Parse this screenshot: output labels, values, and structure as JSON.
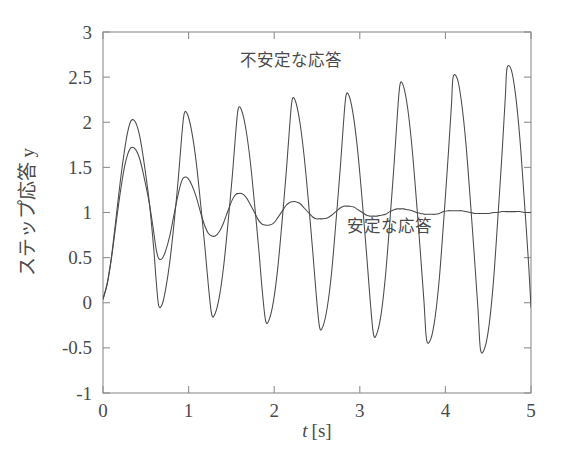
{
  "chart_data": {
    "type": "line",
    "title": "",
    "xlabel": "t [s]",
    "ylabel": "ステップ応答 y",
    "xlim": [
      0,
      5
    ],
    "ylim": [
      -1,
      3
    ],
    "grid": false,
    "legend_position": "inline-annotation",
    "xticks": [
      "0",
      "1",
      "2",
      "3",
      "4",
      "5"
    ],
    "xtick_values": [
      0,
      1,
      2,
      3,
      4,
      5
    ],
    "yticks": [
      "-1",
      "-0.5",
      "0",
      "0.5",
      "1",
      "1.5",
      "2",
      "2.5",
      "3"
    ],
    "ytick_values": [
      -1,
      -0.5,
      0,
      0.5,
      1,
      1.5,
      2,
      2.5,
      3
    ],
    "annotations": [
      {
        "text": "不安定な応答",
        "x": 2.2,
        "y": 2.62
      },
      {
        "text": "安定な応答",
        "x": 3.35,
        "y": 0.78
      }
    ],
    "series": [
      {
        "name": "不安定な応答",
        "label": "unstable-response",
        "color": "#4a4a4a",
        "steady_state": 1.0,
        "period": 0.63,
        "peaks": [
          {
            "t": 0.33,
            "y": 2.02
          },
          {
            "t": 0.95,
            "y": 2.1
          },
          {
            "t": 1.58,
            "y": 2.15
          },
          {
            "t": 2.21,
            "y": 2.25
          },
          {
            "t": 2.84,
            "y": 2.3
          },
          {
            "t": 3.47,
            "y": 2.42
          },
          {
            "t": 4.09,
            "y": 2.5
          },
          {
            "t": 4.72,
            "y": 2.6
          }
        ],
        "troughs": [
          {
            "t": 0.65,
            "y": -0.03
          },
          {
            "t": 1.27,
            "y": -0.13
          },
          {
            "t": 1.9,
            "y": -0.2
          },
          {
            "t": 2.53,
            "y": -0.27
          },
          {
            "t": 3.16,
            "y": -0.35
          },
          {
            "t": 3.78,
            "y": -0.41
          },
          {
            "t": 4.41,
            "y": -0.52
          }
        ],
        "points": [
          [
            0.0,
            0.04
          ],
          [
            0.05,
            0.22
          ],
          [
            0.1,
            0.52
          ],
          [
            0.15,
            0.92
          ],
          [
            0.2,
            1.33
          ],
          [
            0.25,
            1.68
          ],
          [
            0.29,
            1.9
          ],
          [
            0.33,
            2.02
          ],
          [
            0.38,
            2.0
          ],
          [
            0.43,
            1.84
          ],
          [
            0.48,
            1.55
          ],
          [
            0.54,
            1.12
          ],
          [
            0.59,
            0.63
          ],
          [
            0.62,
            0.26
          ],
          [
            0.65,
            -0.03
          ],
          [
            0.69,
            -0.02
          ],
          [
            0.73,
            0.14
          ],
          [
            0.78,
            0.45
          ],
          [
            0.83,
            0.88
          ],
          [
            0.88,
            1.38
          ],
          [
            0.92,
            1.85
          ],
          [
            0.95,
            2.1
          ],
          [
            0.99,
            2.08
          ],
          [
            1.04,
            1.88
          ],
          [
            1.09,
            1.55
          ],
          [
            1.14,
            1.1
          ],
          [
            1.19,
            0.62
          ],
          [
            1.23,
            0.2
          ],
          [
            1.27,
            -0.13
          ],
          [
            1.31,
            -0.12
          ],
          [
            1.36,
            0.07
          ],
          [
            1.41,
            0.41
          ],
          [
            1.46,
            0.88
          ],
          [
            1.51,
            1.4
          ],
          [
            1.55,
            1.88
          ],
          [
            1.58,
            2.15
          ],
          [
            1.62,
            2.13
          ],
          [
            1.67,
            1.92
          ],
          [
            1.72,
            1.57
          ],
          [
            1.77,
            1.1
          ],
          [
            1.82,
            0.59
          ],
          [
            1.86,
            0.14
          ],
          [
            1.9,
            -0.2
          ],
          [
            1.94,
            -0.19
          ],
          [
            1.99,
            0.01
          ],
          [
            2.04,
            0.37
          ],
          [
            2.09,
            0.88
          ],
          [
            2.14,
            1.44
          ],
          [
            2.18,
            1.95
          ],
          [
            2.21,
            2.25
          ],
          [
            2.25,
            2.23
          ],
          [
            2.3,
            2.0
          ],
          [
            2.35,
            1.62
          ],
          [
            2.4,
            1.12
          ],
          [
            2.45,
            0.57
          ],
          [
            2.49,
            0.1
          ],
          [
            2.53,
            -0.27
          ],
          [
            2.57,
            -0.26
          ],
          [
            2.62,
            -0.05
          ],
          [
            2.67,
            0.33
          ],
          [
            2.72,
            0.88
          ],
          [
            2.77,
            1.47
          ],
          [
            2.81,
            2.0
          ],
          [
            2.84,
            2.3
          ],
          [
            2.88,
            2.28
          ],
          [
            2.93,
            2.04
          ],
          [
            2.98,
            1.64
          ],
          [
            3.03,
            1.11
          ],
          [
            3.08,
            0.53
          ],
          [
            3.12,
            0.04
          ],
          [
            3.16,
            -0.35
          ],
          [
            3.2,
            -0.34
          ],
          [
            3.25,
            -0.12
          ],
          [
            3.3,
            0.3
          ],
          [
            3.35,
            0.89
          ],
          [
            3.4,
            1.53
          ],
          [
            3.44,
            2.1
          ],
          [
            3.47,
            2.42
          ],
          [
            3.51,
            2.4
          ],
          [
            3.56,
            2.15
          ],
          [
            3.61,
            1.72
          ],
          [
            3.66,
            1.15
          ],
          [
            3.71,
            0.53
          ],
          [
            3.75,
            0.01
          ],
          [
            3.78,
            -0.41
          ],
          [
            3.83,
            -0.4
          ],
          [
            3.88,
            -0.16
          ],
          [
            3.93,
            0.28
          ],
          [
            3.98,
            0.91
          ],
          [
            4.03,
            1.59
          ],
          [
            4.07,
            2.18
          ],
          [
            4.09,
            2.5
          ],
          [
            4.14,
            2.48
          ],
          [
            4.19,
            2.21
          ],
          [
            4.24,
            1.76
          ],
          [
            4.29,
            1.15
          ],
          [
            4.34,
            0.49
          ],
          [
            4.38,
            -0.06
          ],
          [
            4.41,
            -0.52
          ],
          [
            4.46,
            -0.5
          ],
          [
            4.51,
            -0.25
          ],
          [
            4.56,
            0.22
          ],
          [
            4.61,
            0.9
          ],
          [
            4.66,
            1.63
          ],
          [
            4.7,
            2.28
          ],
          [
            4.72,
            2.6
          ],
          [
            4.77,
            2.58
          ],
          [
            4.82,
            2.3
          ],
          [
            4.87,
            1.82
          ],
          [
            4.92,
            1.16
          ],
          [
            4.97,
            0.46
          ],
          [
            5.0,
            -0.05
          ]
        ]
      },
      {
        "name": "安定な応答",
        "label": "stable-response",
        "color": "#4a4a4a",
        "steady_state": 1.0,
        "period": 0.63,
        "peaks": [
          {
            "t": 0.33,
            "y": 1.72
          },
          {
            "t": 0.95,
            "y": 1.39
          },
          {
            "t": 1.58,
            "y": 1.21
          },
          {
            "t": 2.21,
            "y": 1.12
          },
          {
            "t": 2.84,
            "y": 1.07
          },
          {
            "t": 3.47,
            "y": 1.04
          },
          {
            "t": 4.09,
            "y": 1.02
          },
          {
            "t": 4.72,
            "y": 1.01
          }
        ],
        "troughs": [
          {
            "t": 0.65,
            "y": 0.49
          },
          {
            "t": 1.27,
            "y": 0.74
          },
          {
            "t": 1.9,
            "y": 0.86
          },
          {
            "t": 2.53,
            "y": 0.93
          },
          {
            "t": 3.16,
            "y": 0.96
          },
          {
            "t": 3.78,
            "y": 0.98
          },
          {
            "t": 4.41,
            "y": 0.99
          }
        ],
        "points": [
          [
            0.0,
            0.04
          ],
          [
            0.05,
            0.21
          ],
          [
            0.1,
            0.5
          ],
          [
            0.15,
            0.86
          ],
          [
            0.2,
            1.21
          ],
          [
            0.25,
            1.5
          ],
          [
            0.29,
            1.65
          ],
          [
            0.33,
            1.72
          ],
          [
            0.38,
            1.7
          ],
          [
            0.43,
            1.59
          ],
          [
            0.48,
            1.39
          ],
          [
            0.54,
            1.11
          ],
          [
            0.59,
            0.8
          ],
          [
            0.62,
            0.6
          ],
          [
            0.65,
            0.49
          ],
          [
            0.69,
            0.49
          ],
          [
            0.73,
            0.57
          ],
          [
            0.78,
            0.74
          ],
          [
            0.83,
            0.98
          ],
          [
            0.88,
            1.21
          ],
          [
            0.92,
            1.35
          ],
          [
            0.95,
            1.39
          ],
          [
            0.99,
            1.38
          ],
          [
            1.04,
            1.3
          ],
          [
            1.09,
            1.17
          ],
          [
            1.14,
            1.0
          ],
          [
            1.19,
            0.85
          ],
          [
            1.23,
            0.77
          ],
          [
            1.27,
            0.74
          ],
          [
            1.31,
            0.74
          ],
          [
            1.36,
            0.79
          ],
          [
            1.41,
            0.89
          ],
          [
            1.46,
            1.02
          ],
          [
            1.51,
            1.14
          ],
          [
            1.55,
            1.2
          ],
          [
            1.58,
            1.21
          ],
          [
            1.62,
            1.21
          ],
          [
            1.67,
            1.17
          ],
          [
            1.72,
            1.09
          ],
          [
            1.77,
            1.0
          ],
          [
            1.82,
            0.91
          ],
          [
            1.86,
            0.87
          ],
          [
            1.9,
            0.86
          ],
          [
            1.94,
            0.86
          ],
          [
            1.99,
            0.88
          ],
          [
            2.04,
            0.94
          ],
          [
            2.09,
            1.01
          ],
          [
            2.14,
            1.08
          ],
          [
            2.18,
            1.11
          ],
          [
            2.21,
            1.12
          ],
          [
            2.25,
            1.12
          ],
          [
            2.3,
            1.1
          ],
          [
            2.35,
            1.05
          ],
          [
            2.4,
            1.0
          ],
          [
            2.45,
            0.95
          ],
          [
            2.49,
            0.93
          ],
          [
            2.53,
            0.93
          ],
          [
            2.57,
            0.93
          ],
          [
            2.62,
            0.94
          ],
          [
            2.67,
            0.97
          ],
          [
            2.72,
            1.01
          ],
          [
            2.77,
            1.05
          ],
          [
            2.81,
            1.07
          ],
          [
            2.84,
            1.07
          ],
          [
            2.88,
            1.07
          ],
          [
            2.93,
            1.06
          ],
          [
            2.98,
            1.03
          ],
          [
            3.03,
            1.0
          ],
          [
            3.08,
            0.97
          ],
          [
            3.12,
            0.96
          ],
          [
            3.16,
            0.96
          ],
          [
            3.2,
            0.96
          ],
          [
            3.25,
            0.97
          ],
          [
            3.3,
            0.98
          ],
          [
            3.35,
            1.01
          ],
          [
            3.4,
            1.03
          ],
          [
            3.44,
            1.04
          ],
          [
            3.47,
            1.04
          ],
          [
            3.51,
            1.04
          ],
          [
            3.56,
            1.03
          ],
          [
            3.61,
            1.02
          ],
          [
            3.66,
            1.0
          ],
          [
            3.71,
            0.99
          ],
          [
            3.75,
            0.98
          ],
          [
            3.78,
            0.98
          ],
          [
            3.83,
            0.98
          ],
          [
            3.88,
            0.98
          ],
          [
            3.93,
            0.99
          ],
          [
            3.98,
            1.01
          ],
          [
            4.03,
            1.02
          ],
          [
            4.07,
            1.02
          ],
          [
            4.09,
            1.02
          ],
          [
            4.14,
            1.02
          ],
          [
            4.19,
            1.02
          ],
          [
            4.24,
            1.01
          ],
          [
            4.29,
            1.0
          ],
          [
            4.34,
            0.99
          ],
          [
            4.38,
            0.99
          ],
          [
            4.41,
            0.99
          ],
          [
            4.46,
            0.99
          ],
          [
            4.51,
            0.99
          ],
          [
            4.56,
            1.0
          ],
          [
            4.61,
            1.0
          ],
          [
            4.66,
            1.01
          ],
          [
            4.7,
            1.01
          ],
          [
            4.72,
            1.01
          ],
          [
            4.77,
            1.01
          ],
          [
            4.82,
            1.01
          ],
          [
            4.87,
            1.01
          ],
          [
            4.92,
            1.0
          ],
          [
            4.97,
            1.0
          ],
          [
            5.0,
            1.0
          ]
        ]
      }
    ]
  }
}
